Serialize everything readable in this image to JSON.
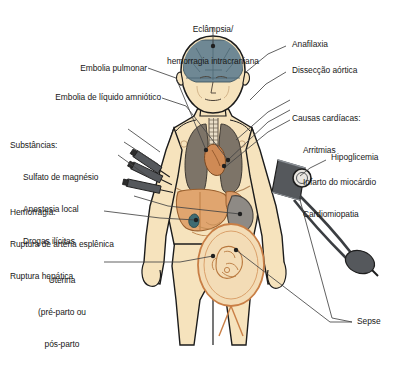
{
  "figure": {
    "background_color": "#ffffff",
    "skin_color": "#f6e3bd",
    "outline_color": "#1c1c1c",
    "lung_color": "#7d7468",
    "brain_color": "#6f8894",
    "liver_color": "#e0a56f",
    "spleen_color": "#8e8a85",
    "uterus_color": "#c97f46",
    "cuff_color": "#55585c",
    "leader_color": "#3c3c3c"
  },
  "labels": {
    "eclampsia": {
      "line1": "Eclâmpsia/",
      "line2": "hemorragia intracraniana"
    },
    "anafilaxia": "Anafilaxia",
    "disseccao": "Dissecção aórtica",
    "cardiacas": {
      "heading": "Causas cardíacas:",
      "items": [
        "Arritmias",
        "Infarto do miocárdio",
        "Cardiomiopatia"
      ]
    },
    "hipoglicemia": "Hipoglicemia",
    "embolia_pulmonar": "Embolia pulmonar",
    "embolia_amniotico": "Embolia de líquido amniótico",
    "substancias": {
      "heading": "Substâncias:",
      "items": [
        "Sulfato de magnésio",
        "Anestesia local",
        "Drogas ilícitas"
      ]
    },
    "hemorragia": {
      "heading": "Hemorragia:",
      "items": [
        "Ruptura de artéria esplênica",
        "Ruptura hepática"
      ]
    },
    "uterina": {
      "line1": "Uterina",
      "line2": "(pré-parto ou",
      "line3": "pós-parto"
    },
    "sepse": "Sepse"
  },
  "anatomy": {
    "brain": "brain",
    "trachea": "trachea",
    "lung_left": "left-lung",
    "lung_right": "right-lung",
    "heart": "heart",
    "liver": "liver",
    "spleen": "spleen",
    "stomach": "stomach",
    "uterus": "uterus-with-fetus",
    "syringes": "syringes",
    "bp_cuff": "blood-pressure-cuff"
  }
}
